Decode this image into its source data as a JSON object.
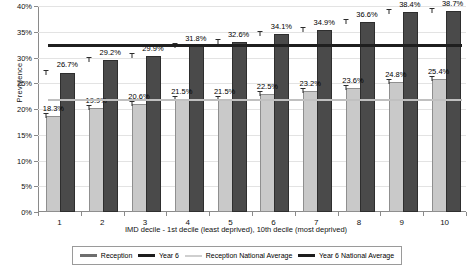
{
  "chart_data": {
    "type": "bar",
    "title": "",
    "xlabel": "IMD decile - 1st decile (least deprived), 10th decile (most deprived)",
    "ylabel": "Prevalence",
    "categories": [
      "1",
      "2",
      "3",
      "4",
      "5",
      "6",
      "7",
      "8",
      "9",
      "10"
    ],
    "ylim": [
      0,
      40
    ],
    "ytick_labels": [
      "0%",
      "5%",
      "10%",
      "15%",
      "20%",
      "25%",
      "30%",
      "35%",
      "40%"
    ],
    "ytick_values": [
      0,
      5,
      10,
      15,
      20,
      25,
      30,
      35,
      40
    ],
    "grid": true,
    "legend_position": "bottom",
    "series": [
      {
        "name": "Reception",
        "color": "#c9c9c9",
        "values": [
          18.3,
          19.9,
          20.6,
          21.5,
          21.5,
          22.5,
          23.2,
          23.6,
          24.8,
          25.4
        ],
        "labels": [
          "18.3%",
          "19.9%",
          "20.6%",
          "21.5%",
          "21.5%",
          "22.5%",
          "23.2%",
          "23.6%",
          "24.8%",
          "25.4%"
        ]
      },
      {
        "name": "Year 6",
        "color": "#4a4a4a",
        "values": [
          26.7,
          29.2,
          29.9,
          31.8,
          32.6,
          34.1,
          34.9,
          36.6,
          38.4,
          38.7
        ],
        "labels": [
          "26.7%",
          "29.2%",
          "29.9%",
          "31.8%",
          "32.6%",
          "34.1%",
          "34.9%",
          "36.6%",
          "38.4%",
          "38.7%"
        ]
      }
    ],
    "reference_lines": [
      {
        "name": "Reception National Average",
        "value": 22.0,
        "color": "#c0c0c0"
      },
      {
        "name": "Year 6 National Average",
        "value": 32.6,
        "color": "#1f1f1f"
      }
    ],
    "legend": [
      {
        "label": "Reception",
        "swatch": "sw-reception"
      },
      {
        "label": "Year 6",
        "swatch": "sw-year6"
      },
      {
        "label": "Reception National Average",
        "swatch": "sw-recavg"
      },
      {
        "label": "Year 6 National Average",
        "swatch": "sw-y6avg"
      }
    ]
  }
}
